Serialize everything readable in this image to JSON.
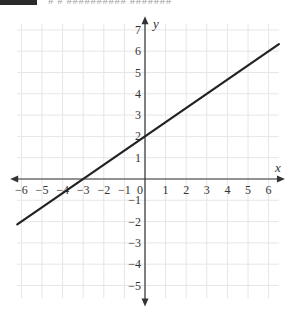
{
  "header": {
    "badge_color": "#2a2a2a",
    "text": "# # ########## #######"
  },
  "chart_data": {
    "type": "line",
    "title": "",
    "xlabel": "x",
    "ylabel": "y",
    "xlim": [
      -6.2,
      6.5
    ],
    "ylim": [
      -5.6,
      7.3
    ],
    "grid": true,
    "x_ticks": [
      -6,
      -5,
      -4,
      -3,
      -2,
      -1,
      0,
      1,
      2,
      3,
      4,
      5,
      6
    ],
    "y_ticks": [
      -5,
      -4,
      -3,
      -2,
      -1,
      1,
      2,
      3,
      4,
      5,
      6,
      7
    ],
    "origin_label": "0",
    "series": [
      {
        "name": "line",
        "equation": "y = (2/3)x + 2",
        "slope": 0.6667,
        "y_intercept": 2,
        "x_intercept": -3,
        "x": [
          -6.2,
          6.5
        ],
        "y": [
          -2.13,
          6.33
        ],
        "color": "#222222"
      }
    ]
  }
}
